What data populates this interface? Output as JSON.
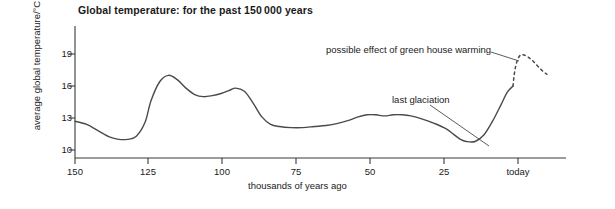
{
  "chart_data": {
    "type": "line",
    "title": "Global temperature: for the past 150 000 years",
    "xlabel": "thousands of years ago",
    "ylabel": "average global temperature/°C",
    "xlim": [
      150,
      -12
    ],
    "ylim": [
      9,
      20.5
    ],
    "grid": false,
    "legend": "none",
    "x_ticks": [
      {
        "value": 150,
        "label": "150"
      },
      {
        "value": 125,
        "label": "125"
      },
      {
        "value": 100,
        "label": "100"
      },
      {
        "value": 75,
        "label": "75"
      },
      {
        "value": 50,
        "label": "50"
      },
      {
        "value": 25,
        "label": "25"
      },
      {
        "value": 0,
        "label": "today"
      }
    ],
    "y_ticks": [
      {
        "value": 19,
        "label": "19"
      },
      {
        "value": 16,
        "label": "16"
      },
      {
        "value": 13,
        "label": "13"
      },
      {
        "value": 10,
        "label": "10"
      }
    ],
    "series": [
      {
        "name": "observed global temperature",
        "style": "solid",
        "x": [
          150,
          146,
          142,
          138,
          135,
          132,
          129,
          126,
          124,
          121,
          118,
          115,
          112,
          109,
          106,
          103,
          100,
          97,
          95,
          92,
          89,
          86,
          83,
          80,
          76,
          72,
          68,
          64,
          60,
          56,
          53,
          50,
          47,
          44,
          41,
          38,
          35,
          31,
          27,
          23,
          20,
          18,
          16,
          13,
          10,
          7,
          4,
          2,
          0
        ],
        "y": [
          12.7,
          12.4,
          11.8,
          11.2,
          11.0,
          11.0,
          11.3,
          12.6,
          14.6,
          16.4,
          17.0,
          16.6,
          15.8,
          15.2,
          15.0,
          15.1,
          15.3,
          15.6,
          15.8,
          15.5,
          14.4,
          13.1,
          12.4,
          12.2,
          12.1,
          12.1,
          12.2,
          12.3,
          12.5,
          12.8,
          13.1,
          13.3,
          13.3,
          13.2,
          13.3,
          13.3,
          13.2,
          12.9,
          12.5,
          12.0,
          11.4,
          11.0,
          10.8,
          10.8,
          11.4,
          12.7,
          14.3,
          15.4,
          16.0
        ]
      },
      {
        "name": "possible effect of green house warming",
        "style": "dashed",
        "x": [
          0,
          -0.3,
          -0.8,
          -1.6,
          -2.6,
          -3.8,
          -5.2,
          -6.6,
          -8.0,
          -9.4,
          -10.6,
          -11.6
        ],
        "y": [
          16.0,
          16.8,
          17.7,
          18.5,
          18.9,
          18.9,
          18.7,
          18.4,
          18.0,
          17.6,
          17.3,
          17.1
        ]
      }
    ],
    "annotations": [
      {
        "name": "greenhouse",
        "text": "possible effect of green house warming",
        "leader_from": [
          491,
          52
        ],
        "leader_to": [
          519,
          60
        ]
      },
      {
        "name": "glaciation",
        "text": "last glaciation",
        "leader_from": [
          430,
          105
        ],
        "leader_to": [
          489,
          146
        ]
      }
    ]
  }
}
